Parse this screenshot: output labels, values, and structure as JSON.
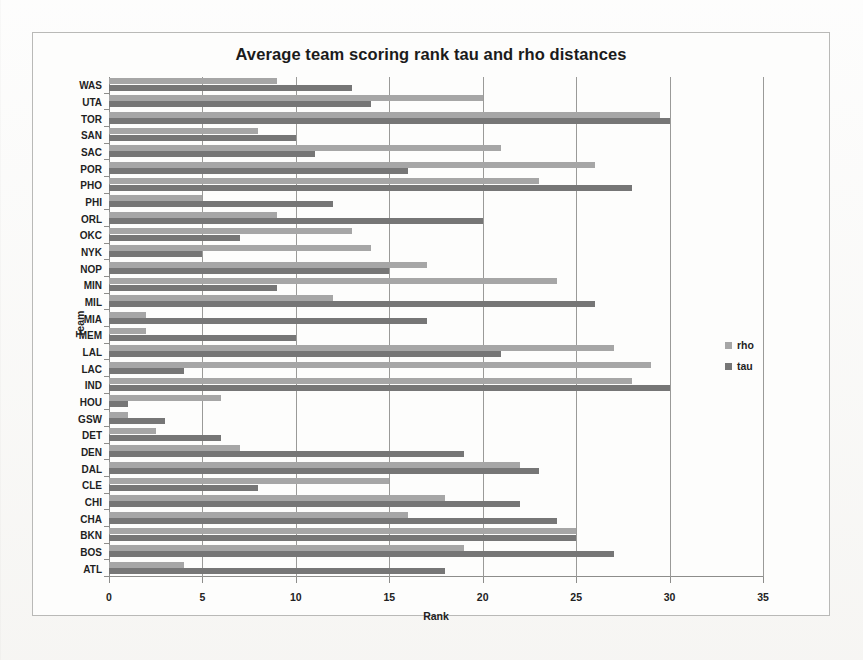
{
  "chart_data": {
    "type": "bar",
    "orientation": "horizontal",
    "title": "Average team scoring rank tau and rho distances",
    "xlabel": "Rank",
    "ylabel": "Team",
    "xlim": [
      0,
      35
    ],
    "xticks": [
      0,
      5,
      10,
      15,
      20,
      25,
      30,
      35
    ],
    "grid": true,
    "legend_position": "right",
    "categories": [
      "WAS",
      "UTA",
      "TOR",
      "SAN",
      "SAC",
      "POR",
      "PHO",
      "PHI",
      "ORL",
      "OKC",
      "NYK",
      "NOP",
      "MIN",
      "MIL",
      "MIA",
      "MEM",
      "LAL",
      "LAC",
      "IND",
      "HOU",
      "GSW",
      "DET",
      "DEN",
      "DAL",
      "CLE",
      "CHI",
      "CHA",
      "BKN",
      "BOS",
      "ATL"
    ],
    "series": [
      {
        "name": "rho",
        "color": "#a6a6a6",
        "values": [
          9,
          20,
          29.5,
          8,
          21,
          26,
          23,
          5,
          9,
          13,
          14,
          17,
          24,
          12,
          2,
          2,
          27,
          29,
          28,
          6,
          1,
          2.5,
          7,
          22,
          15,
          18,
          16,
          25,
          19,
          4
        ]
      },
      {
        "name": "tau",
        "color": "#767676",
        "values": [
          13,
          14,
          30,
          10,
          11,
          16,
          28,
          12,
          20,
          7,
          5,
          15,
          9,
          26,
          17,
          10,
          21,
          4,
          30,
          1,
          3,
          6,
          19,
          23,
          8,
          22,
          24,
          25,
          27,
          18
        ]
      }
    ]
  },
  "legend": {
    "items": [
      {
        "label": "rho",
        "color": "#a6a6a6"
      },
      {
        "label": "tau",
        "color": "#767676"
      }
    ]
  }
}
